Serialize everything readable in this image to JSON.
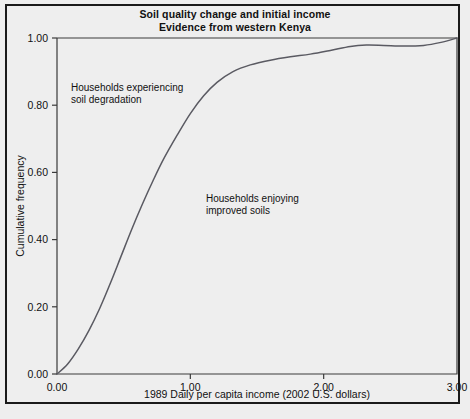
{
  "figure": {
    "title_line1": "Soil quality change and initial income",
    "title_line2": "Evidence from western Kenya",
    "background_color": "#eeeeee",
    "border_color": "#1a1a1a",
    "curve_color": "#5a5a62",
    "axis_color": "#3a3a3a"
  },
  "chart_data": {
    "type": "line",
    "title": "Soil quality change and initial income\nEvidence from western Kenya",
    "xlabel": "1989 Daily per capita income (2002 U.S. dollars)",
    "ylabel": "Cumulative frequency",
    "xlim": [
      0.0,
      3.0
    ],
    "ylim": [
      0.0,
      1.0
    ],
    "xticks": [
      0.0,
      1.0,
      2.0,
      3.0
    ],
    "xtick_labels": [
      "0.00",
      "1.00",
      "2.00",
      "3.00"
    ],
    "yticks": [
      0.0,
      0.2,
      0.4,
      0.6,
      0.8,
      1.0
    ],
    "ytick_labels": [
      "0.00",
      "0.20",
      "0.40",
      "0.60",
      "0.80",
      "1.00"
    ],
    "grid": false,
    "legend": "none",
    "series": [
      {
        "name": "Cumulative frequency of 1989 daily per capita income",
        "x": [
          0.0,
          0.08,
          0.16,
          0.24,
          0.32,
          0.4,
          0.48,
          0.56,
          0.64,
          0.72,
          0.8,
          0.9,
          1.0,
          1.1,
          1.2,
          1.32,
          1.45,
          1.6,
          1.75,
          1.9,
          2.05,
          2.2,
          2.32,
          2.45,
          2.6,
          2.75,
          2.88,
          3.0
        ],
        "y": [
          0.0,
          0.03,
          0.075,
          0.13,
          0.195,
          0.27,
          0.35,
          0.43,
          0.505,
          0.575,
          0.64,
          0.71,
          0.775,
          0.828,
          0.868,
          0.9,
          0.92,
          0.934,
          0.944,
          0.952,
          0.963,
          0.975,
          0.979,
          0.978,
          0.976,
          0.978,
          0.987,
          1.0
        ]
      }
    ],
    "annotations": [
      {
        "id": "degradation-annotation",
        "line1": "Households experiencing",
        "line2": "soil degradation",
        "x_px": 71,
        "y_px": 91
      },
      {
        "id": "improved-annotation",
        "line1": "Households enjoying",
        "line2": "improved soils",
        "x_px": 206,
        "y_px": 202
      }
    ]
  }
}
